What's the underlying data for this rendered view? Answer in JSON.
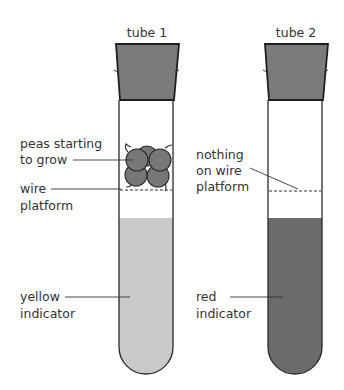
{
  "diagram": {
    "tubes": [
      {
        "title": "tube 1",
        "contents_label": [
          "peas starting",
          "to grow"
        ],
        "platform_label": [
          "wire",
          "platform"
        ],
        "indicator_label": [
          "yellow",
          "indicator"
        ]
      },
      {
        "title": "tube 2",
        "contents_label": [
          "nothing",
          "on wire",
          "platform"
        ],
        "indicator_label": [
          "red",
          "indicator"
        ]
      }
    ],
    "colors": {
      "stopper": "#7b7b7b",
      "yellow_indicator": "#c9c9c9",
      "red_indicator": "#6b6b6b",
      "pea": "#777777",
      "outline": "#2a2a2a"
    }
  }
}
